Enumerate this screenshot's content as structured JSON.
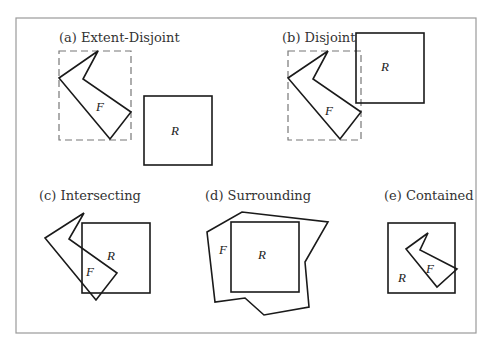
{
  "figure": {
    "panels": [
      {
        "id": "a",
        "title": "(a) Extent-Disjoint",
        "feature_label": "F",
        "region_label": "R",
        "extent_shown": true
      },
      {
        "id": "b",
        "title": "(b) Disjoint",
        "feature_label": "F",
        "region_label": "R",
        "extent_shown": true
      },
      {
        "id": "c",
        "title": "(c) Intersecting",
        "feature_label": "F",
        "region_label": "R",
        "extent_shown": false
      },
      {
        "id": "d",
        "title": "(d) Surrounding",
        "feature_label": "F",
        "region_label": "R",
        "extent_shown": false
      },
      {
        "id": "e",
        "title": "(e) Contained",
        "feature_label": "F",
        "region_label": "R",
        "extent_shown": false
      }
    ]
  },
  "colors": {
    "stroke": "#1a1a1a",
    "extent_stroke": "#777777",
    "frame": "#9a9a9a",
    "text": "#333333",
    "background": "#ffffff"
  }
}
